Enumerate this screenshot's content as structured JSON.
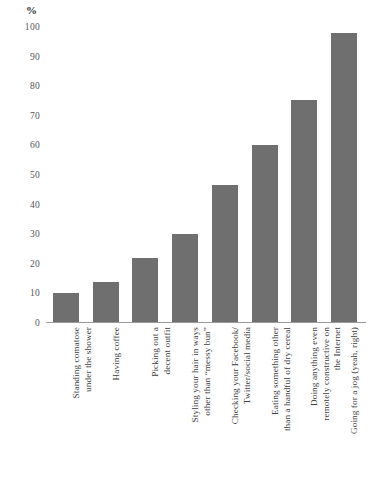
{
  "chart_data": {
    "type": "bar",
    "title": "",
    "subtitle": "",
    "xlabel": "",
    "ylabel": "%",
    "unit_label": "%",
    "ylim": [
      0,
      100
    ],
    "ytick_values": [
      0,
      10,
      20,
      30,
      40,
      50,
      60,
      70,
      80,
      90,
      100
    ],
    "ytick_labels": [
      "0",
      "10",
      "20",
      "30",
      "40",
      "50",
      "60",
      "70",
      "80",
      "90",
      "100"
    ],
    "grid": false,
    "legend": false,
    "bar_color": "#6f6f6f",
    "axis_color": "#9a9a9a",
    "categories": [
      "Standing comatose\nunder the shower",
      "Having coffee",
      "Picking out a\ndecent outfit",
      "Styling your hair in ways\nother than “messy bun”",
      "Checking your Facebook/\nTwitter/social media",
      "Eating something other\nthan a handful of dry cereal",
      "Doing anything even\nremotely constructive on\nthe Internet",
      "Going for a jog (yeah, right)"
    ],
    "values": [
      10,
      14,
      22,
      30,
      46.5,
      60,
      75.5,
      98
    ]
  }
}
